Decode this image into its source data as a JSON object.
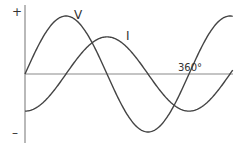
{
  "chart_data": {
    "type": "line",
    "title": "",
    "xlabel": "",
    "ylabel": "",
    "axis_labels": {
      "positive": "+",
      "negative": "–",
      "x_mark": "360°"
    },
    "x_unit": "degrees",
    "xlim": [
      0,
      460
    ],
    "ylim": [
      -1,
      1
    ],
    "grid": false,
    "legend": "inline labels",
    "series": [
      {
        "name": "V",
        "label": "V",
        "amplitude": 1.0,
        "phase_deg": 0,
        "color": "#444444"
      },
      {
        "name": "I",
        "label": "I",
        "amplitude": 0.64,
        "phase_deg": -90,
        "color": "#444444"
      }
    ],
    "annotations": [
      {
        "text": "V",
        "near": "V peak at 90°"
      },
      {
        "text": "I",
        "near": "I peak at 180°"
      },
      {
        "text": "360°",
        "near": "x-axis at 360°"
      }
    ]
  },
  "labels": {
    "plus": "+",
    "minus": "–",
    "v": "V",
    "i": "I",
    "deg360": "360°"
  },
  "colors": {
    "axis": "#8a8a8a",
    "curve": "#444444",
    "text": "#333333"
  }
}
